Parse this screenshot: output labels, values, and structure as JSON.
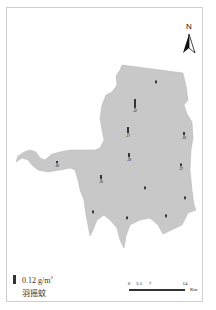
{
  "map": {
    "type": "sampling-site density map",
    "region_fill": "#c8c8c8",
    "marker_color": "#333333",
    "north_arrow": {
      "label": "N"
    },
    "legend": {
      "symbol": "bar",
      "value": "0.12",
      "unit": "g/m",
      "unit_superscript": "2",
      "species": "羽摇蚊"
    },
    "scale_bar": {
      "ticks": [
        "0",
        "3.5",
        "7",
        "14"
      ],
      "unit": "Km"
    },
    "sites": [
      {
        "id": "site-north",
        "label": "",
        "x": 156,
        "y": 82,
        "bar_height": 1.5
      },
      {
        "id": "site-central-large",
        "label": "J2",
        "x": 135,
        "y": 107,
        "bar_height": 8
      },
      {
        "id": "site-central",
        "label": "J7",
        "x": 128,
        "y": 132,
        "bar_height": 5
      },
      {
        "id": "site-east-upper",
        "label": "J3",
        "x": 184,
        "y": 134,
        "bar_height": 2
      },
      {
        "id": "site-center-lower",
        "label": "J9",
        "x": 129,
        "y": 156,
        "bar_height": 3
      },
      {
        "id": "site-east-lower",
        "label": "J1",
        "x": 181,
        "y": 165,
        "bar_height": 1.5
      },
      {
        "id": "site-west-arm",
        "label": "J6",
        "x": 57,
        "y": 162,
        "bar_height": 1
      },
      {
        "id": "site-southwest",
        "label": "J5",
        "x": 101,
        "y": 178,
        "bar_height": 3
      },
      {
        "id": "site-south-center",
        "label": "",
        "x": 145,
        "y": 188,
        "bar_height": 1.5
      },
      {
        "id": "site-southeast-edge",
        "label": "",
        "x": 185,
        "y": 198,
        "bar_height": 1.5
      },
      {
        "id": "site-southwest-lobe",
        "label": "",
        "x": 93,
        "y": 212,
        "bar_height": 1.5
      },
      {
        "id": "site-south-lobe",
        "label": "",
        "x": 127,
        "y": 218,
        "bar_height": 1.5
      },
      {
        "id": "site-southeast",
        "label": "",
        "x": 166,
        "y": 216,
        "bar_height": 1.5
      }
    ]
  }
}
